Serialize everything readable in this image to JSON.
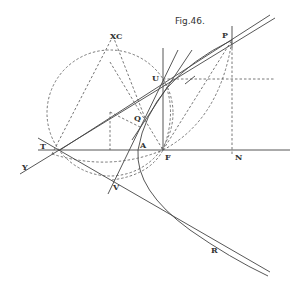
{
  "figure": {
    "title": "Fig.46.",
    "labels": {
      "P": "P",
      "U": "U",
      "XC": "XC",
      "Q": "Q",
      "T": "T",
      "A": "A",
      "F": "F",
      "N": "N",
      "Y": "Y",
      "V": "V",
      "R": "R"
    },
    "colors": {
      "ink": "#444444",
      "background": "#ffffff"
    }
  }
}
